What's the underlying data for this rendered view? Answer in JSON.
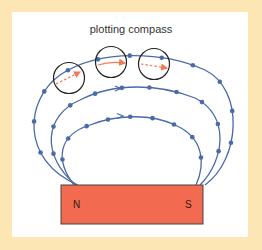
{
  "title": "plotting compass",
  "magnet": {
    "north_label": "N",
    "south_label": "S",
    "color": "#f26a4f"
  },
  "colors": {
    "background": "#fbe6b4",
    "panel": "#ffffff",
    "field_line": "#4a6aa8",
    "dot": "#4a6aa8",
    "compass_needle": "#f07a55",
    "compass_outline": "#222222"
  },
  "field_lines": [
    {
      "name": "outer",
      "direction": "N-to-S",
      "dot_count": 11,
      "arrow": false
    },
    {
      "name": "middle",
      "direction": "N-to-S",
      "dot_count": 10,
      "arrow": true
    },
    {
      "name": "inner",
      "direction": "N-to-S",
      "dot_count": 9,
      "arrow": true
    }
  ],
  "compasses": [
    {
      "position": "left",
      "needle": "dashed"
    },
    {
      "position": "center",
      "needle": "solid"
    },
    {
      "position": "right",
      "needle": "dashed"
    }
  ]
}
